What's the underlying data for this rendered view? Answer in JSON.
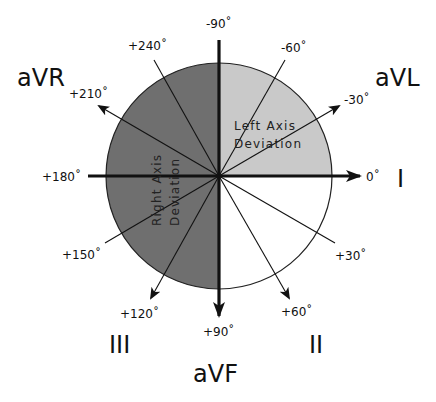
{
  "diagram": {
    "center": {
      "x": 219,
      "y": 176
    },
    "radius": 113,
    "colors": {
      "right_axis_deviation": "#6f6f6f",
      "left_axis_deviation": "#c9c9c9",
      "normal": "#ffffff",
      "lines": "#111111"
    },
    "regions": {
      "left_axis_deviation": {
        "line1": "Left Axis",
        "line2": "Deviation",
        "from_deg": -90,
        "to_deg": 0
      },
      "right_axis_deviation": {
        "line1": "Right Axis",
        "line2": "Deviation",
        "from_deg": 90,
        "to_deg": 270
      }
    },
    "angle_labels": {
      "m90": "-90˚",
      "m60": "-60˚",
      "m30": "-30˚",
      "p0": "0˚",
      "p30": "+30˚",
      "p60": "+60˚",
      "p90": "+90˚",
      "p120": "+120˚",
      "p150": "+150˚",
      "p180": "+180˚",
      "p210": "+210˚",
      "p240": "+240˚"
    },
    "leads": {
      "I": "I",
      "II": "II",
      "III": "III",
      "aVR": "aVR",
      "aVL": "aVL",
      "aVF": "aVF"
    }
  }
}
